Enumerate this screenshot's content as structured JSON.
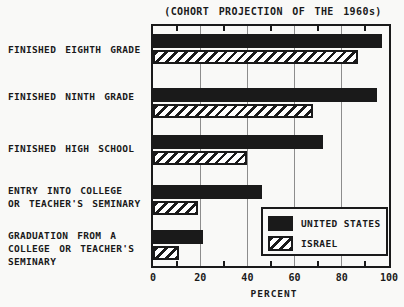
{
  "title": "(COHORT PROJECTION OF THE 1960s)",
  "colors": {
    "background": "#f9f9f7",
    "bar_black": "#1a1a1a",
    "gridline_gray": "#8d8d8d",
    "hatch_foreground": "#1a1a1a",
    "hatch_background": "#ffffff"
  },
  "legend": {
    "entries": [
      {
        "label": "UNITED STATES",
        "swatch": "solid-black"
      },
      {
        "label": "ISRAEL",
        "swatch": "diagonal-hatch"
      }
    ]
  },
  "chart_data": {
    "type": "bar",
    "orientation": "horizontal",
    "title": "(COHORT PROJECTION OF THE 1960s)",
    "categories": [
      [
        "FINISHED EIGHTH GRADE"
      ],
      [
        "FINISHED NINTH GRADE"
      ],
      [
        "FINISHED HIGH SCHOOL"
      ],
      [
        "ENTRY INTO COLLEGE",
        "OR TEACHER'S SEMINARY"
      ],
      [
        "GRADUATION FROM A",
        "COLLEGE OR TEACHER'S",
        "SEMINARY"
      ]
    ],
    "series": [
      {
        "name": "UNITED STATES",
        "style": "solid-black",
        "values": [
          97,
          95,
          72,
          46,
          21
        ]
      },
      {
        "name": "ISRAEL",
        "style": "diagonal-hatch",
        "values": [
          87,
          68,
          40,
          19,
          11
        ]
      }
    ],
    "xlabel": "PERCENT",
    "xlim": [
      0,
      100
    ],
    "xticks": [
      0,
      20,
      40,
      60,
      80,
      100
    ],
    "xtick_labels": [
      "0",
      "20",
      "40",
      "60",
      "80",
      "100"
    ],
    "minor_ticks": [
      10,
      30,
      50,
      70,
      90
    ],
    "grid": "vertical-at-major-ticks",
    "legend_position": "inside-lower-right"
  }
}
